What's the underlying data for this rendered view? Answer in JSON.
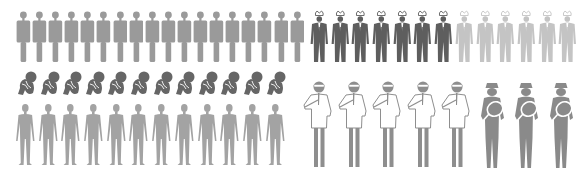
{
  "infographic": {
    "groups": [
      {
        "id": "standing-people",
        "count": 18,
        "color": "#9a9a9a",
        "icon": "standing-person-icon"
      },
      {
        "id": "suited-crowned-people",
        "dark_count": 7,
        "light_count": 6,
        "dark_color": "#5e5e5e",
        "light_color": "#c4c4c4",
        "icon": "crowned-suit-person-icon"
      },
      {
        "id": "fetal-figures",
        "count": 12,
        "color": "#666666",
        "icon": "fetal-figure-icon"
      },
      {
        "id": "anatomical-bodies",
        "count": 12,
        "color": "#a3a3a3",
        "icon": "anatomical-body-icon"
      },
      {
        "id": "lab-scientists",
        "count": 5,
        "color": "#8e8e8e",
        "icon": "scientist-pipette-icon"
      },
      {
        "id": "investigators",
        "count": 3,
        "color": "#8a8a8a",
        "icon": "magnifying-glass-person-icon"
      }
    ]
  }
}
